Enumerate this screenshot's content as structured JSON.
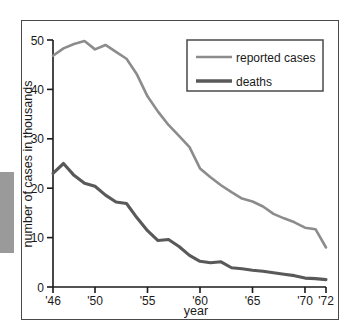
{
  "figure": {
    "frame_color": "#4a4a4a",
    "background": "#ffffff",
    "edge_artifact_color": "#9a9a9a"
  },
  "axes": {
    "y_label": "number of cases in thousands",
    "x_label": "year",
    "y_ticks": [
      "0",
      "10",
      "20",
      "30",
      "40",
      "50"
    ],
    "x_ticks": [
      "'46",
      "'50",
      "'55",
      "'60",
      "'65",
      "'70",
      "'72"
    ]
  },
  "legend": {
    "items": [
      {
        "label": "reported cases",
        "color": "#8c8c8c",
        "width": 2.6
      },
      {
        "label": "deaths",
        "color": "#595959",
        "width": 3.4
      }
    ]
  },
  "chart_data": {
    "type": "line",
    "title": "",
    "xlabel": "year",
    "ylabel": "number of cases in thousands",
    "xlim": [
      1946,
      1972
    ],
    "ylim": [
      0,
      50
    ],
    "grid": false,
    "legend_position": "top-right",
    "x_tick_values": [
      1946,
      1950,
      1955,
      1960,
      1965,
      1970,
      1972
    ],
    "x_tick_labels": [
      "'46",
      "'50",
      "'55",
      "'60",
      "'65",
      "'70",
      "'72"
    ],
    "y_tick_values": [
      0,
      10,
      20,
      30,
      40,
      50
    ],
    "y_tick_labels": [
      "0",
      "10",
      "20",
      "30",
      "40",
      "50"
    ],
    "x": [
      1946,
      1947,
      1948,
      1949,
      1950,
      1951,
      1952,
      1953,
      1954,
      1955,
      1956,
      1957,
      1958,
      1959,
      1960,
      1961,
      1962,
      1963,
      1964,
      1965,
      1966,
      1967,
      1968,
      1969,
      1970,
      1971,
      1972
    ],
    "series": [
      {
        "name": "reported cases",
        "color": "#8c8c8c",
        "values": [
          46.8,
          48.3,
          49.2,
          49.8,
          48.1,
          49.0,
          47.6,
          46.2,
          43.0,
          38.6,
          35.5,
          32.8,
          30.6,
          28.3,
          24.0,
          22.2,
          20.6,
          19.2,
          17.9,
          17.3,
          16.3,
          14.8,
          13.9,
          13.1,
          12.0,
          11.7,
          8.0
        ]
      },
      {
        "name": "deaths",
        "color": "#595959",
        "values": [
          23.0,
          25.0,
          22.6,
          21.0,
          20.4,
          18.6,
          17.2,
          16.9,
          14.0,
          11.4,
          9.4,
          9.6,
          8.2,
          6.4,
          5.2,
          4.9,
          5.1,
          3.9,
          3.7,
          3.4,
          3.2,
          2.9,
          2.6,
          2.3,
          1.8,
          1.7,
          1.5
        ]
      }
    ]
  }
}
